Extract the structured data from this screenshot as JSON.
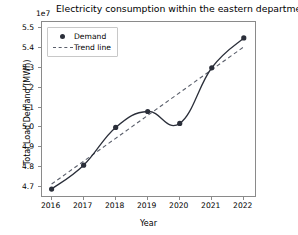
{
  "chart_data": {
    "type": "line",
    "title": "Electricity consumption within the eastern department",
    "xlabel": "Year",
    "ylabel": "Total Load Demand (MWh)",
    "y_offset_label": "1e7",
    "x": [
      2016,
      2017,
      2018,
      2019,
      2020,
      2021,
      2022
    ],
    "xtick_labels": [
      "2016",
      "2017",
      "2018",
      "2019",
      "2020",
      "2021",
      "2022"
    ],
    "ytick_labels": [
      "4.7",
      "4.8",
      "4.9",
      "5.0",
      "5.1",
      "5.2",
      "5.3",
      "5.4",
      "5.5"
    ],
    "ytick_values": [
      4.7,
      4.8,
      4.9,
      5.0,
      5.1,
      5.2,
      5.3,
      5.4,
      5.5
    ],
    "xlim": [
      2015.7,
      2022.35
    ],
    "ylim": [
      4.655,
      5.53
    ],
    "grid": false,
    "legend_position": "upper left",
    "series": [
      {
        "name": "Demand",
        "style": "smooth-line-with-markers",
        "color": "#2b2f3a",
        "marker": "circle",
        "values": [
          4.69,
          4.81,
          5.0,
          5.08,
          5.02,
          5.3,
          5.45
        ]
      },
      {
        "name": "Trend line",
        "style": "dashed",
        "color": "#5a5f6b",
        "endpoints_x": [
          2016,
          2022
        ],
        "endpoints_y": [
          4.715,
          5.405
        ]
      }
    ]
  },
  "legend": {
    "items": [
      {
        "label": "Demand",
        "symbol": "filled-circle-marker"
      },
      {
        "label": "Trend line",
        "symbol": "dashed-line"
      }
    ]
  }
}
